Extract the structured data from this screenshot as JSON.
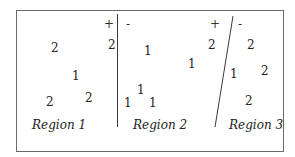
{
  "regions": [
    {
      "label": "Region 1",
      "numbers": [
        "2",
        "1",
        "2",
        "2"
      ],
      "sign_plus": "+",
      "edge_number": "2"
    },
    {
      "label": "Region 2",
      "sign_minus": "-",
      "numbers": [
        "1",
        "1",
        "1",
        "1",
        "1"
      ],
      "sign_plus": "+",
      "edge_number": "2"
    },
    {
      "label": "Region 3",
      "sign_minus": "-",
      "numbers": [
        "2",
        "1",
        "2",
        "2"
      ]
    }
  ]
}
